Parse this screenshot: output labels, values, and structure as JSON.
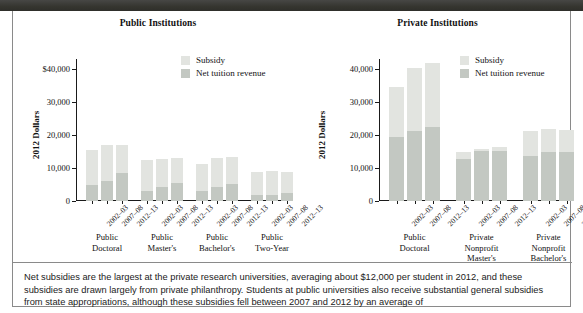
{
  "topbar": {
    "present": true,
    "color": "#3a3a38"
  },
  "colors": {
    "subsidy": "#e2e4e0",
    "net_tuition": "#c3c8c2",
    "axis": "#1a1a1a",
    "frame": "#8a8a8a"
  },
  "legend": {
    "subsidy_label": "Subsidy",
    "tuition_label": "Net tuition revenue"
  },
  "caption": {
    "text": "Net subsidies are the largest at the private research universities, averaging about $12,000 per student in 2012, and these subsidies are drawn largely from private philanthropy. Students at public universities also receive substantial general subsidies from state appropriations, although these subsidies fell between 2007 and 2012 by an average of"
  },
  "chart_data": [
    {
      "type": "bar",
      "stacked": true,
      "title": "Public Institutions",
      "xlabel": "",
      "ylabel": "2012 Dollars",
      "ylim": [
        0,
        43000
      ],
      "yticks": [
        0,
        10000,
        20000,
        30000,
        40000
      ],
      "ytick_labels": [
        "0",
        "10,000",
        "20,000",
        "30,000",
        "$40,000"
      ],
      "grid": false,
      "legend_position": "top-center-right",
      "groups": [
        {
          "label": "Public\nDoctoral",
          "line1": "Public",
          "line2": "Doctoral",
          "line3": ""
        },
        {
          "label": "Public\nMaster's",
          "line1": "Public",
          "line2": "Master's",
          "line3": ""
        },
        {
          "label": "Public\nBachelor's",
          "line1": "Public",
          "line2": "Bachelor's",
          "line3": ""
        },
        {
          "label": "Public\nTwo-Year",
          "line1": "Public",
          "line2": "Two-Year",
          "line3": ""
        }
      ],
      "categories": [
        "2002–03",
        "2007–08",
        "2012–13",
        "2002–03",
        "2007–08",
        "2012–13",
        "2002–03",
        "2007–08",
        "2012–13",
        "2002–03",
        "2007–08",
        "2012–13"
      ],
      "series": [
        {
          "name": "Net tuition revenue",
          "values": [
            5000,
            6200,
            8400,
            3100,
            4200,
            5500,
            3100,
            4200,
            5100,
            1800,
            1900,
            2300
          ]
        },
        {
          "name": "Subsidy",
          "values": [
            10500,
            10800,
            8600,
            9300,
            8600,
            7400,
            8100,
            8700,
            8200,
            6900,
            7200,
            6600
          ]
        }
      ],
      "totals": [
        15500,
        17000,
        17000,
        12400,
        12800,
        12900,
        11200,
        12900,
        13300,
        8700,
        9100,
        8900
      ]
    },
    {
      "type": "bar",
      "stacked": true,
      "title": "Private Institutions",
      "xlabel": "",
      "ylabel": "2012 Dollars",
      "ylim": [
        0,
        43000
      ],
      "yticks": [
        0,
        10000,
        20000,
        30000,
        40000
      ],
      "ytick_labels": [
        "0",
        "10,000",
        "20,000",
        "30,000",
        "40,000"
      ],
      "grid": false,
      "legend_position": "top-center-right",
      "groups": [
        {
          "label": "Public\nDoctoral",
          "line1": "Public",
          "line2": "Doctoral",
          "line3": ""
        },
        {
          "label": "Private\nNonprofit\nMaster's",
          "line1": "Private",
          "line2": "Nonprofit",
          "line3": "Master's"
        },
        {
          "label": "Private\nNonprofit\nBachelor's",
          "line1": "Private",
          "line2": "Nonprofit",
          "line3": "Bachelor's"
        }
      ],
      "categories": [
        "2002–03",
        "2007–08",
        "2012–13",
        "2002–03",
        "2007–08",
        "2012–13",
        "2002–03",
        "2007–08",
        "2012–13"
      ],
      "series": [
        {
          "name": "Net tuition revenue",
          "values": [
            19400,
            21300,
            22500,
            12800,
            15200,
            15100,
            13500,
            14700,
            14700
          ]
        },
        {
          "name": "Subsidy",
          "values": [
            15200,
            19000,
            19200,
            2100,
            700,
            1300,
            7600,
            7000,
            6900
          ]
        }
      ],
      "totals": [
        34600,
        40300,
        41700,
        14900,
        15900,
        16400,
        21100,
        21700,
        21600
      ]
    }
  ]
}
